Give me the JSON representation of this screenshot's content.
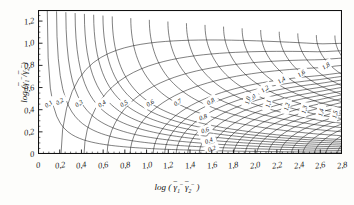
{
  "figure": {
    "type": "nomogram",
    "background": "#fdfdfb",
    "plot_background": "#ffffff",
    "line_color": "#1a1a1a"
  },
  "axes": {
    "x": {
      "label_parts": {
        "log": "log (",
        "g1": "γ",
        "sub1": "1",
        "g2": "γ",
        "sub2": "2",
        "close": " )",
        "overbar": "‾",
        "minus": "−"
      },
      "label_plain": "log ( γ̄₁⁻ γ̄₂⁻ )",
      "ticks": [
        "0",
        "0,2",
        "0,4",
        "0,6",
        "0,8",
        "1,0",
        "1,2",
        "1,4",
        "1,6",
        "1,8",
        "2,0",
        "2,2",
        "2,4",
        "2,6",
        "2,8"
      ],
      "values": [
        0,
        0.2,
        0.4,
        0.6,
        0.8,
        1.0,
        1.2,
        1.4,
        1.6,
        1.8,
        2.0,
        2.2,
        2.4,
        2.6,
        2.8
      ],
      "min": 0,
      "max": 2.8
    },
    "y": {
      "label_plain": "log ( γ̄₁⁻ / γ̄₂⁻ )",
      "ticks": [
        "0",
        "0,2",
        "0,4",
        "0,6",
        "0,8",
        "1,0",
        "1,2"
      ],
      "values": [
        0,
        0.2,
        0.4,
        0.6,
        0.8,
        1.0,
        1.2
      ],
      "min": 0,
      "max": 1.3
    }
  },
  "chart_data": {
    "type": "line",
    "title": "",
    "xlabel": "log ( γ̄1⁻ γ̄2⁻ )",
    "ylabel": "log ( γ̄1⁻ / γ̄2⁻ )",
    "xlim": [
      0,
      2.8
    ],
    "ylim": [
      0,
      1.3
    ],
    "grid": false,
    "legend": "none",
    "families": [
      {
        "name": "family-a-diagonal",
        "description": "Family of curves running lower-left to upper-right, labels placed along the diagonal band descending from upper-left",
        "labels": [
          "0,1",
          "0,2",
          "0,3",
          "0,4",
          "0,5",
          "0,6",
          "0,7",
          "0,8",
          "1,0",
          "1,2",
          "1,4",
          "1,6",
          "1,8",
          "2,0",
          "2,2",
          "2,4",
          "2,6",
          "2,8",
          "3,0",
          "3,2"
        ],
        "values": [
          0.1,
          0.2,
          0.3,
          0.4,
          0.5,
          0.6,
          0.7,
          0.8,
          1.0,
          1.2,
          1.4,
          1.6,
          1.8,
          2.0,
          2.2,
          2.4,
          2.6,
          2.8,
          3.0,
          3.2
        ]
      },
      {
        "name": "family-b-vertical",
        "description": "Family of near-vertical curves fanning out to the right, labels rotated vertically",
        "labels": [
          "0,2",
          "0,4",
          "0,6",
          "0,8",
          "1,0",
          "1,1",
          "1,2",
          "1,3",
          "1,4",
          "1,5",
          "1,6",
          "1,7",
          "1,8",
          "1,9",
          "2,0",
          "2,1",
          "2,2",
          "2,3",
          "2,4"
        ],
        "values": [
          0.2,
          0.4,
          0.6,
          0.8,
          1.0,
          1.1,
          1.2,
          1.3,
          1.4,
          1.5,
          1.6,
          1.7,
          1.8,
          1.9,
          2.0,
          2.1,
          2.2,
          2.3,
          2.4
        ]
      }
    ]
  }
}
